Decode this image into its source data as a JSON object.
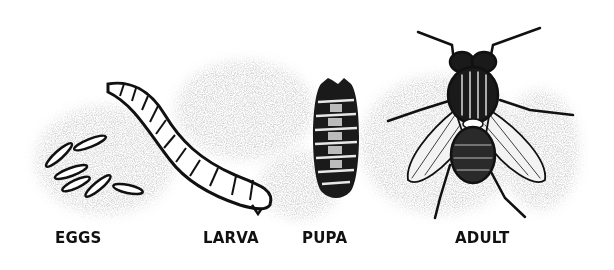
{
  "diagram": {
    "stages": [
      {
        "id": "eggs",
        "label": "EGGS",
        "icon": "eggs-icon"
      },
      {
        "id": "larva",
        "label": "LARVA",
        "icon": "larva-icon"
      },
      {
        "id": "pupa",
        "label": "PUPA",
        "icon": "pupa-icon"
      },
      {
        "id": "adult",
        "label": "ADULT",
        "icon": "adult-fly-icon"
      }
    ],
    "colors": {
      "background": "#ffffff",
      "shading": "#9a9a9a",
      "ink": "#111111"
    }
  }
}
